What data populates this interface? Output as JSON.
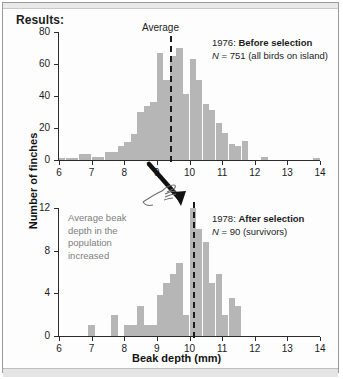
{
  "figure": {
    "title": "Results:",
    "yaxis_title": "Number of finches",
    "xaxis_title": "Beak depth (mm)"
  },
  "annotations": {
    "average_label": "Average",
    "increase_note": "Average beak\ndepth in the\npopulation\nincreased",
    "hand_icon": "pointing-hand-icon",
    "arrow_icon": "down-right-arrow-icon"
  },
  "colors": {
    "bar_fill": "#b6b6b6",
    "axis": "#2b2b2b",
    "text": "#1c1c1c",
    "note_text": "#7d7d7d",
    "average_line": "#1a1a1a",
    "panel_background": "#fdfdfd"
  },
  "panels": [
    {
      "id": "panel-1976",
      "year": "1976:",
      "condition": "Before selection",
      "n_prefix": "N",
      "n_value": "= 751 (all birds on island)",
      "caption_full": "1976: Before selection",
      "n_full": "N = 751 (all birds on island)"
    },
    {
      "id": "panel-1978",
      "year": "1978:",
      "condition": "After selection",
      "n_prefix": "N",
      "n_value": "= 90 (survivors)",
      "caption_full": "1978: After selection",
      "n_full": "N = 90 (survivors)"
    }
  ],
  "chart_data": [
    {
      "type": "bar",
      "id": "histogram-1976",
      "title": "1976: Before selection",
      "subtitle": "N = 751 (all birds on island)",
      "xlabel": "Beak depth (mm)",
      "ylabel": "Number of finches",
      "xlim": [
        6,
        14
      ],
      "ylim": [
        0,
        80
      ],
      "xticks": [
        6,
        7,
        8,
        9,
        10,
        11,
        12,
        13,
        14
      ],
      "yticks": [
        0,
        20,
        40,
        60,
        80
      ],
      "grid": false,
      "bin_width": 0.2,
      "average": 9.4,
      "average_label": "Average",
      "bins": [
        6.0,
        6.2,
        6.4,
        6.6,
        6.8,
        7.0,
        7.2,
        7.4,
        7.6,
        7.8,
        8.0,
        8.2,
        8.4,
        8.6,
        8.8,
        9.0,
        9.2,
        9.4,
        9.6,
        9.8,
        10.0,
        10.2,
        10.4,
        10.6,
        10.8,
        11.0,
        11.2,
        11.4,
        11.6,
        11.8,
        12.0,
        12.2,
        12.4,
        13.8
      ],
      "values": [
        1,
        1,
        1,
        4,
        4,
        2,
        2,
        5,
        5,
        9,
        11,
        16,
        30,
        34,
        36,
        67,
        50,
        65,
        70,
        41,
        63,
        50,
        35,
        31,
        23,
        17,
        10,
        9,
        12,
        0,
        0,
        2,
        0,
        1
      ]
    },
    {
      "type": "bar",
      "id": "histogram-1978",
      "title": "1978: After selection",
      "subtitle": "N = 90 (survivors)",
      "xlabel": "Beak depth (mm)",
      "ylabel": "Number of finches",
      "xlim": [
        6,
        14
      ],
      "ylim": [
        0,
        12
      ],
      "xticks": [
        6,
        7,
        8,
        9,
        10,
        11,
        12,
        13,
        14
      ],
      "yticks": [
        0,
        4,
        8,
        12
      ],
      "grid": false,
      "bin_width": 0.2,
      "average": 10.1,
      "annotation": "Average beak depth in the population increased",
      "bins": [
        6.9,
        7.6,
        8.0,
        8.2,
        8.4,
        8.6,
        8.8,
        9.0,
        9.2,
        9.4,
        9.6,
        9.8,
        10.0,
        10.2,
        10.4,
        10.6,
        10.8,
        11.0,
        11.2,
        11.4
      ],
      "values": [
        1,
        2,
        1,
        1,
        2.8,
        1,
        1,
        3.8,
        5,
        5.8,
        6.8,
        2,
        12,
        10,
        8.8,
        5,
        5.8,
        2,
        3.6,
        2.8
      ]
    }
  ]
}
